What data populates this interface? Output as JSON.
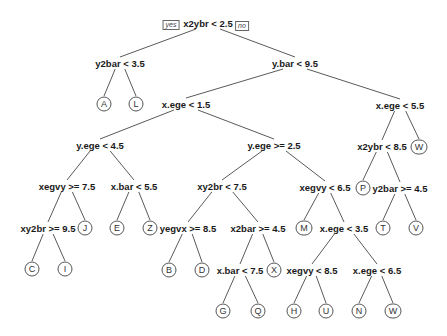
{
  "diagram": {
    "type": "decision-tree",
    "branch_labels": {
      "yes": "yes",
      "no": "no"
    },
    "splits": [
      {
        "id": "n1",
        "label": "x2ybr < 2.5",
        "x": 208,
        "y": 23
      },
      {
        "id": "n2",
        "label": "y2bar < 3.5",
        "x": 120,
        "y": 63
      },
      {
        "id": "n3",
        "label": "y.bar < 9.5",
        "x": 295,
        "y": 63
      },
      {
        "id": "n6",
        "label": "x.ege < 1.5",
        "x": 186,
        "y": 104
      },
      {
        "id": "n7",
        "label": "x.ege < 5.5",
        "x": 400,
        "y": 105
      },
      {
        "id": "n12",
        "label": "y.ege < 4.5",
        "x": 100,
        "y": 145
      },
      {
        "id": "n13",
        "label": "y.ege >= 2.5",
        "x": 274,
        "y": 145
      },
      {
        "id": "n14",
        "label": "x2ybr < 8.5",
        "x": 382,
        "y": 146
      },
      {
        "id": "n24",
        "label": "xegvy >= 7.5",
        "x": 67,
        "y": 186
      },
      {
        "id": "n25",
        "label": "x.bar < 5.5",
        "x": 134,
        "y": 186
      },
      {
        "id": "n26",
        "label": "xy2br < 7.5",
        "x": 222,
        "y": 186
      },
      {
        "id": "n27",
        "label": "xegvy < 6.5",
        "x": 325,
        "y": 187
      },
      {
        "id": "n29",
        "label": "y2bar >= 4.5",
        "x": 400,
        "y": 188
      },
      {
        "id": "n48",
        "label": "xy2br >= 9.5",
        "x": 48,
        "y": 228
      },
      {
        "id": "n52",
        "label": "yegvx >= 8.5",
        "x": 188,
        "y": 228
      },
      {
        "id": "n53",
        "label": "x2bar >= 4.5",
        "x": 258,
        "y": 228
      },
      {
        "id": "n55",
        "label": "x.ege < 3.5",
        "x": 344,
        "y": 228
      },
      {
        "id": "n106",
        "label": "x.bar < 7.5",
        "x": 240,
        "y": 270
      },
      {
        "id": "n110",
        "label": "xegvy < 8.5",
        "x": 312,
        "y": 270
      },
      {
        "id": "n111",
        "label": "x.ege < 6.5",
        "x": 377,
        "y": 270
      }
    ],
    "leaves": [
      {
        "id": "l4",
        "label": "A",
        "x": 104,
        "y": 104
      },
      {
        "id": "l5",
        "label": "L",
        "x": 136,
        "y": 104
      },
      {
        "id": "l15",
        "label": "W",
        "x": 419,
        "y": 147
      },
      {
        "id": "l49",
        "label": "J",
        "x": 85,
        "y": 228
      },
      {
        "id": "l50",
        "label": "E",
        "x": 117,
        "y": 228
      },
      {
        "id": "l51",
        "label": "Z",
        "x": 150,
        "y": 228
      },
      {
        "id": "l54",
        "label": "M",
        "x": 304,
        "y": 228
      },
      {
        "id": "l28",
        "label": "P",
        "x": 363,
        "y": 188
      },
      {
        "id": "l58",
        "label": "T",
        "x": 383,
        "y": 228
      },
      {
        "id": "l59",
        "label": "V",
        "x": 416,
        "y": 228
      },
      {
        "id": "l96",
        "label": "C",
        "x": 32,
        "y": 269
      },
      {
        "id": "l97",
        "label": "I",
        "x": 65,
        "y": 269
      },
      {
        "id": "l104",
        "label": "B",
        "x": 169,
        "y": 270
      },
      {
        "id": "l105",
        "label": "D",
        "x": 202,
        "y": 270
      },
      {
        "id": "l107",
        "label": "X",
        "x": 274,
        "y": 270
      },
      {
        "id": "l212",
        "label": "G",
        "x": 223,
        "y": 311
      },
      {
        "id": "l213",
        "label": "Q",
        "x": 258,
        "y": 311
      },
      {
        "id": "l220",
        "label": "H",
        "x": 294,
        "y": 311
      },
      {
        "id": "l221",
        "label": "U",
        "x": 326,
        "y": 311
      },
      {
        "id": "l222",
        "label": "N",
        "x": 359,
        "y": 311
      },
      {
        "id": "l223",
        "label": "W",
        "x": 393,
        "y": 311
      }
    ],
    "edges": [
      [
        "n1",
        "n2"
      ],
      [
        "n1",
        "n3"
      ],
      [
        "n2",
        "l4"
      ],
      [
        "n2",
        "l5"
      ],
      [
        "n3",
        "n6"
      ],
      [
        "n3",
        "n7"
      ],
      [
        "n6",
        "n12"
      ],
      [
        "n6",
        "n13"
      ],
      [
        "n7",
        "n14"
      ],
      [
        "n7",
        "l15"
      ],
      [
        "n12",
        "n24"
      ],
      [
        "n12",
        "n25"
      ],
      [
        "n13",
        "n26"
      ],
      [
        "n13",
        "n27"
      ],
      [
        "n14",
        "l28"
      ],
      [
        "n14",
        "n29"
      ],
      [
        "n24",
        "n48"
      ],
      [
        "n24",
        "l49"
      ],
      [
        "n25",
        "l50"
      ],
      [
        "n25",
        "l51"
      ],
      [
        "n26",
        "n52"
      ],
      [
        "n26",
        "n53"
      ],
      [
        "n27",
        "l54"
      ],
      [
        "n27",
        "n55"
      ],
      [
        "n29",
        "l58"
      ],
      [
        "n29",
        "l59"
      ],
      [
        "n48",
        "l96"
      ],
      [
        "n48",
        "l97"
      ],
      [
        "n52",
        "l104"
      ],
      [
        "n52",
        "l105"
      ],
      [
        "n53",
        "n106"
      ],
      [
        "n53",
        "l107"
      ],
      [
        "n55",
        "n110"
      ],
      [
        "n55",
        "n111"
      ],
      [
        "n106",
        "l212"
      ],
      [
        "n106",
        "l213"
      ],
      [
        "n110",
        "l220"
      ],
      [
        "n110",
        "l221"
      ],
      [
        "n111",
        "l222"
      ],
      [
        "n111",
        "l223"
      ]
    ]
  }
}
